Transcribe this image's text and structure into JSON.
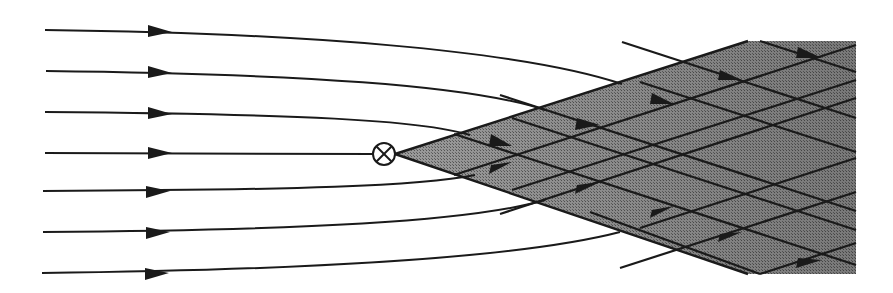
{
  "diagram": {
    "title": "",
    "colors": {
      "background": "#ffffff",
      "line": "#1a1a1a",
      "shade": "#8a8a8a",
      "shade_dark": "#6e6e6e"
    },
    "marker": {
      "icon": "circled-x-icon",
      "x": 384,
      "y": 154,
      "r": 11
    },
    "streamlines": [
      {
        "y0": 30,
        "arrow_x": 160
      },
      {
        "y0": 71,
        "arrow_x": 160
      },
      {
        "y0": 112,
        "arrow_x": 160
      },
      {
        "y0": 152,
        "arrow_x": 160
      },
      {
        "y0": 191,
        "arrow_x": 158
      },
      {
        "y0": 232,
        "arrow_x": 158
      },
      {
        "y0": 273,
        "arrow_x": 158
      }
    ],
    "region": {
      "apex_x": 395,
      "apex_y": 154,
      "top_y": 41,
      "bottom_y": 274,
      "corner_x": 748,
      "right_x": 856
    }
  }
}
